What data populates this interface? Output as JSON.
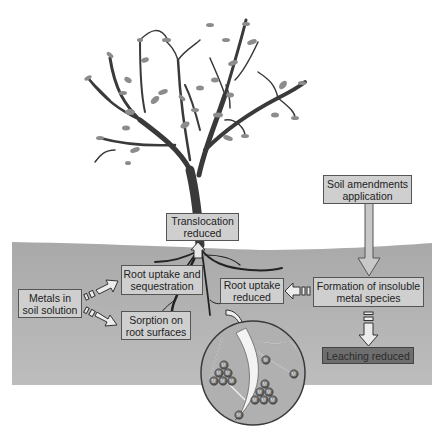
{
  "diagram": {
    "type": "process-diagram",
    "colors": {
      "soil": "#b3b3b3",
      "box_fill": "#cfcfcf",
      "box_border": "#555555",
      "leaching_box_fill": "#6e6e6e",
      "tree": "#3a3a3a",
      "leaves": "#8c8c8c",
      "arrow_fill": "#e0e0e0"
    },
    "nodes": {
      "soil_amendments": {
        "line1": "Soil amendments",
        "line2": "application"
      },
      "translocation": {
        "line1": "Translocation",
        "line2": "reduced"
      },
      "root_uptake_seq": {
        "line1": "Root uptake and",
        "line2": "sequestration"
      },
      "metals_solution": {
        "line1": "Metals in",
        "line2": "soil solution"
      },
      "sorption": {
        "line1": "Sorption on",
        "line2": "root surfaces"
      },
      "root_uptake_reduced": {
        "line1": "Root uptake",
        "line2": "reduced"
      },
      "insoluble_formation": {
        "line1": "Formation of insoluble",
        "line2": "metal species"
      },
      "leaching": {
        "line1": "Leaching reduced"
      }
    },
    "inset": {
      "description": "Magnified root zone with metal ions",
      "ion_label": "M",
      "ion_superscript": "+",
      "ion_clusters": 2,
      "ions_per_cluster": 6,
      "isolated_ions": 4
    },
    "edges": [
      {
        "from": "metals_solution",
        "to": "root_uptake_seq"
      },
      {
        "from": "metals_solution",
        "to": "sorption"
      },
      {
        "from": "soil_amendments",
        "to": "insoluble_formation"
      },
      {
        "from": "insoluble_formation",
        "to": "root_uptake_reduced"
      },
      {
        "from": "insoluble_formation",
        "to": "leaching"
      },
      {
        "from": "roots",
        "to": "translocation"
      },
      {
        "from": "roots",
        "to": "inset"
      }
    ]
  }
}
